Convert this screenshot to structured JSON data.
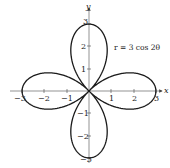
{
  "chart_data": {
    "type": "line",
    "subtype": "polar-curve",
    "title": "",
    "equation": "r = 3 cos 2θ",
    "xlabel": "x",
    "ylabel": "y",
    "xlim": [
      -3,
      3
    ],
    "ylim": [
      -3,
      3
    ],
    "x_ticks": [
      -3,
      -2,
      -1,
      1,
      2,
      3
    ],
    "y_ticks": [
      -3,
      -2,
      -1,
      1,
      2,
      3
    ],
    "x_tick_labels": [
      "−3",
      "−2",
      "−1",
      "1",
      "2",
      "3"
    ],
    "y_tick_labels": [
      "−3",
      "−2",
      "−1",
      "1",
      "2",
      "3"
    ],
    "grid": false,
    "legend": null,
    "series": [
      {
        "name": "r = 3 cos 2θ",
        "description": "four-petaled rose curve, petal tips at (±3,0) and (0,±3)",
        "petal_tips": [
          [
            3,
            0
          ],
          [
            0,
            3
          ],
          [
            -3,
            0
          ],
          [
            0,
            -3
          ]
        ]
      }
    ],
    "annotations": [
      {
        "text": "r = 3 cos 2θ",
        "position": "upper right, near (2.5, 2)"
      }
    ]
  },
  "labels": {
    "x_axis": "x",
    "y_axis": "y",
    "equation": "r = 3 cos 2θ",
    "xt": {
      "n3": "−3",
      "n2": "−2",
      "n1": "−1",
      "p1": "1",
      "p2": "2",
      "p3": "3"
    },
    "yt": {
      "n3": "−3",
      "n2": "−2",
      "n1": "−1",
      "p1": "1",
      "p2": "2",
      "p3": "3"
    }
  },
  "colors": {
    "curve": "#1a1a1a",
    "axis": "#555555",
    "background": "#ffffff"
  }
}
